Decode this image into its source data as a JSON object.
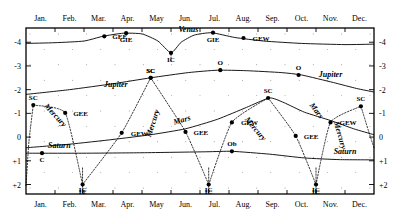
{
  "chart_data": {
    "type": "line",
    "title": "",
    "xlabel": "",
    "ylabel": "",
    "grid": true,
    "legend_position": "inline-curve-labels",
    "x_categories": [
      "Jan.",
      "Feb.",
      "Mar.",
      "Apr.",
      "May",
      "Jun.",
      "Jul.",
      "Aug.",
      "Sep.",
      "Oct.",
      "Nov.",
      "Dec."
    ],
    "y_ticks": [
      "-4",
      "-3",
      "-2",
      "-1",
      "0",
      "+1",
      "+2"
    ],
    "y_values": [
      -4,
      -3,
      -2,
      -1,
      0,
      1,
      2
    ],
    "ylim": [
      -4.6,
      2.4
    ],
    "y_axis_inverted": true,
    "series": [
      {
        "name": "Venus",
        "style": "solid",
        "label_x_month": 5.6,
        "points": [
          {
            "x": 0.0,
            "y": -3.95
          },
          {
            "x": 1.0,
            "y": -3.98
          },
          {
            "x": 2.0,
            "y": -4.05
          },
          {
            "x": 2.65,
            "y": -4.25
          },
          {
            "x": 3.35,
            "y": -4.38
          },
          {
            "x": 4.0,
            "y": -4.35
          },
          {
            "x": 4.55,
            "y": -4.05
          },
          {
            "x": 5.0,
            "y": -3.55
          },
          {
            "x": 5.35,
            "y": -4.0
          },
          {
            "x": 5.8,
            "y": -4.3
          },
          {
            "x": 6.4,
            "y": -4.4
          },
          {
            "x": 7.2,
            "y": -4.2
          },
          {
            "x": 8.2,
            "y": -4.05
          },
          {
            "x": 9.5,
            "y": -3.95
          },
          {
            "x": 11.0,
            "y": -3.9
          },
          {
            "x": 12.0,
            "y": -3.92
          }
        ],
        "events": [
          {
            "label": "GEE",
            "x_month": 2.7,
            "y": -4.25
          },
          {
            "label": "GIE",
            "x_month": 3.45,
            "y": -4.38
          },
          {
            "label": "IC",
            "x_month": 5.0,
            "y": -3.55
          },
          {
            "label": "GIE",
            "x_month": 6.45,
            "y": -4.4
          },
          {
            "label": "GEW",
            "x_month": 7.5,
            "y": -4.18
          }
        ]
      },
      {
        "name": "Jupiter",
        "style": "solid",
        "label_x_month": 3.1,
        "label_x_month_2": 10.6,
        "points": [
          {
            "x": 0.0,
            "y": -1.8
          },
          {
            "x": 1.5,
            "y": -2.0
          },
          {
            "x": 3.0,
            "y": -2.25
          },
          {
            "x": 4.3,
            "y": -2.5
          },
          {
            "x": 5.6,
            "y": -2.72
          },
          {
            "x": 6.6,
            "y": -2.82
          },
          {
            "x": 7.6,
            "y": -2.8
          },
          {
            "x": 8.8,
            "y": -2.72
          },
          {
            "x": 9.5,
            "y": -2.62
          },
          {
            "x": 10.6,
            "y": -2.3
          },
          {
            "x": 11.4,
            "y": -2.05
          },
          {
            "x": 12.0,
            "y": -1.9
          }
        ],
        "events": [
          {
            "label": "SC",
            "x_month": 4.3,
            "y": -2.5
          },
          {
            "label": "O",
            "x_month": 6.7,
            "y": -2.82
          },
          {
            "label": "O",
            "x_month": 9.4,
            "y": -2.62
          }
        ]
      },
      {
        "name": "Mars",
        "style": "solid",
        "label_x_month": 5.6,
        "label_x_month_2": 9.9,
        "points": [
          {
            "x": 0.0,
            "y": 0.45
          },
          {
            "x": 1.5,
            "y": 0.3
          },
          {
            "x": 3.0,
            "y": 0.1
          },
          {
            "x": 4.3,
            "y": -0.1
          },
          {
            "x": 5.5,
            "y": -0.35
          },
          {
            "x": 6.6,
            "y": -0.75
          },
          {
            "x": 7.6,
            "y": -1.25
          },
          {
            "x": 8.4,
            "y": -1.65
          },
          {
            "x": 8.9,
            "y": -1.45
          },
          {
            "x": 9.6,
            "y": -1.05
          },
          {
            "x": 10.5,
            "y": -0.7
          },
          {
            "x": 11.3,
            "y": -0.35
          },
          {
            "x": 12.0,
            "y": -0.1
          }
        ],
        "events": []
      },
      {
        "name": "Saturn",
        "style": "solid",
        "label_x_month": 1.3,
        "label_x_month_2": 11.0,
        "points": [
          {
            "x": 0.0,
            "y": 0.68
          },
          {
            "x": 2.0,
            "y": 0.68
          },
          {
            "x": 4.0,
            "y": 0.66
          },
          {
            "x": 6.2,
            "y": 0.62
          },
          {
            "x": 7.1,
            "y": 0.6
          },
          {
            "x": 8.4,
            "y": 0.72
          },
          {
            "x": 9.6,
            "y": 0.88
          },
          {
            "x": 10.8,
            "y": 0.95
          },
          {
            "x": 12.0,
            "y": 0.96
          }
        ],
        "events": [
          {
            "label": "C",
            "x_month": 0.55,
            "y": 0.68
          },
          {
            "label": "Ob",
            "x_month": 7.1,
            "y": 0.6
          }
        ]
      },
      {
        "name": "Mercury",
        "style": "dotted",
        "label_positions": [
          1.0,
          4.35,
          7.6,
          10.8
        ],
        "events": [
          {
            "label": "SC",
            "x_month": 0.25,
            "y": -1.35
          },
          {
            "label": "GEE",
            "x_month": 1.35,
            "y": -1.02
          },
          {
            "label": "IC",
            "x_month": 1.95,
            "y": 2.0
          },
          {
            "label": "GEW",
            "x_month": 3.3,
            "y": -0.18
          },
          {
            "label": "SC",
            "x_month": 4.3,
            "y": -2.5
          },
          {
            "label": "GEE",
            "x_month": 5.5,
            "y": -0.22
          },
          {
            "label": "IC",
            "x_month": 6.3,
            "y": 2.0
          },
          {
            "label": "GEW",
            "x_month": 7.1,
            "y": -0.62
          },
          {
            "label": "SC",
            "x_month": 8.35,
            "y": -1.65
          },
          {
            "label": "GEE",
            "x_month": 9.3,
            "y": -0.05
          },
          {
            "label": "IC",
            "x_month": 10.0,
            "y": 2.0
          },
          {
            "label": "GEW",
            "x_month": 10.5,
            "y": -0.62
          },
          {
            "label": "SC",
            "x_month": 11.55,
            "y": -1.3
          }
        ]
      }
    ],
    "event_legend": {
      "GEE": "Greatest Elongation East",
      "GEW": "Greatest Elongation West",
      "GIE": "Greatest Illuminated Extent",
      "IC": "Inferior Conjunction",
      "SC": "Superior Conjunction",
      "O": "Opposition",
      "C": "Conjunction"
    }
  },
  "axes": {
    "top_months": [
      "Jan.",
      "Feb.",
      "Mar.",
      "Apr.",
      "May",
      "Jun.",
      "Jul.",
      "Aug.",
      "Sep.",
      "Oct.",
      "Nov.",
      "Dec."
    ],
    "bottom_months": [
      "Jan.",
      "Feb.",
      "Mar.",
      "Apr.",
      "May",
      "Jun.",
      "Jul.",
      "Aug.",
      "Sep.",
      "Oct.",
      "Nov.",
      "Dec."
    ],
    "left_ticks": [
      "-4",
      "-3",
      "-2",
      "-1",
      "0",
      "+1",
      "+2"
    ],
    "right_ticks": [
      "-4",
      "-3",
      "-2",
      "-1",
      "0",
      "+1",
      "+2"
    ]
  },
  "bottom_ic_labels": [
    {
      "label": "IC",
      "x_month": 1.95
    },
    {
      "label": "IC",
      "x_month": 6.3
    },
    {
      "label": "IC",
      "x_month": 10.0
    }
  ],
  "curve_labels": [
    {
      "text": "Venus",
      "x_month": 5.6,
      "y": -4.42,
      "rot": 0
    },
    {
      "text": "Jupiter",
      "x_month": 3.1,
      "y": -2.12,
      "rot": 0
    },
    {
      "text": "Jupiter",
      "x_month": 10.5,
      "y": -2.52,
      "rot": 0
    },
    {
      "text": "Mars",
      "x_month": 5.4,
      "y": -0.62,
      "rot": -16
    },
    {
      "text": "Mars",
      "x_month": 9.95,
      "y": -1.05,
      "rot": 52
    },
    {
      "text": "Saturn",
      "x_month": 1.15,
      "y": 0.45,
      "rot": 0
    },
    {
      "text": "Saturn",
      "x_month": 11.0,
      "y": 0.72,
      "rot": 0
    },
    {
      "text": "Mercury",
      "x_month": 0.95,
      "y": -0.85,
      "rot": 47
    },
    {
      "text": "Mercury",
      "x_month": 4.45,
      "y": -0.55,
      "rot": -72
    },
    {
      "text": "Mercury",
      "x_month": 7.85,
      "y": -0.28,
      "rot": 50
    },
    {
      "text": "Mercury",
      "x_month": 10.75,
      "y": -0.05,
      "rot": 74
    }
  ],
  "colors": {
    "ink": "#000000",
    "background": "#ffffff"
  }
}
